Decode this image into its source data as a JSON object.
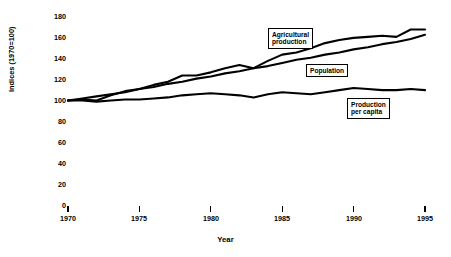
{
  "figure": {
    "y_axis_title": "Indices (1970=100)",
    "x_axis_title": "Year"
  },
  "callouts": {
    "agricultural_production": "Agricultural\nproduction",
    "population": "Population",
    "production_per_capita": "Production\nper capita"
  },
  "axis": {
    "y_ticks": [
      "0",
      "20",
      "40",
      "60",
      "80",
      "100",
      "120",
      "140",
      "160",
      "180"
    ],
    "x_ticks": [
      "1970",
      "1975",
      "1980",
      "1985",
      "1990",
      "1995"
    ]
  },
  "chart_data": {
    "type": "line",
    "title": "",
    "subtitle": "",
    "xlabel": "Year",
    "ylabel": "Indices (1970=100)",
    "xlim": [
      1970,
      1995
    ],
    "ylim": [
      0,
      180
    ],
    "ytick_step": 20,
    "xtick_step": 5,
    "grid": false,
    "legend_position": "inline-callouts",
    "line_color": "#000000",
    "x": [
      1970,
      1971,
      1972,
      1973,
      1974,
      1975,
      1976,
      1977,
      1978,
      1979,
      1980,
      1981,
      1982,
      1983,
      1984,
      1985,
      1986,
      1987,
      1988,
      1989,
      1990,
      1991,
      1992,
      1993,
      1994,
      1995
    ],
    "series": [
      {
        "name": "Agricultural production",
        "values": [
          100,
          101,
          100,
          105,
          109,
          111,
          115,
          118,
          124,
          124,
          127,
          131,
          134,
          131,
          138,
          144,
          146,
          150,
          155,
          158,
          160,
          161,
          162,
          161,
          168,
          168
        ]
      },
      {
        "name": "Population",
        "values": [
          100,
          102,
          104,
          106,
          108,
          111,
          113,
          116,
          118,
          121,
          123,
          126,
          128,
          131,
          133,
          136,
          139,
          141,
          144,
          146,
          149,
          151,
          154,
          156,
          159,
          163
        ]
      },
      {
        "name": "Production per capita",
        "values": [
          100,
          100,
          99,
          100,
          101,
          101,
          102,
          103,
          105,
          106,
          107,
          106,
          105,
          103,
          106,
          108,
          107,
          106,
          108,
          110,
          112,
          111,
          110,
          110,
          111,
          110
        ]
      }
    ]
  }
}
